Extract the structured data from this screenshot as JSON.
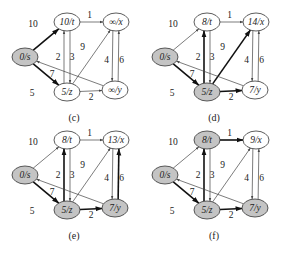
{
  "colors": {
    "shaded": "#c4c4c4",
    "unshaded": "#ffffff",
    "edge": "#444444",
    "edge_bold": "#111111"
  },
  "layout": {
    "node_positions": {
      "s": [
        25,
        57
      ],
      "t": [
        67,
        22
      ],
      "x": [
        116,
        22
      ],
      "z": [
        67,
        92
      ],
      "y": [
        115,
        90
      ]
    },
    "panel_offsets": [
      [
        0,
        0
      ],
      [
        140,
        0
      ],
      [
        0,
        118
      ],
      [
        140,
        118
      ]
    ],
    "caption_pos": [
      74,
      121
    ]
  },
  "edges": [
    {
      "from": "s",
      "to": "t",
      "weight": "10",
      "label_pos": [
        -13,
        -16
      ]
    },
    {
      "from": "s",
      "to": "z",
      "weight": "5",
      "label_pos": [
        -14,
        18
      ]
    },
    {
      "from": "t",
      "to": "x",
      "weight": "1",
      "label_pos": [
        -2,
        -7
      ]
    },
    {
      "from": "t",
      "to": "z",
      "weight": "2",
      "offset": -3,
      "label_pos": [
        -9,
        0
      ]
    },
    {
      "from": "z",
      "to": "t",
      "weight": "3",
      "offset": -3,
      "label_pos": [
        5,
        0
      ]
    },
    {
      "from": "z",
      "to": "x",
      "weight": "9",
      "label_pos": [
        -9,
        -10
      ]
    },
    {
      "from": "x",
      "to": "y",
      "weight": "4",
      "offset": 3,
      "label_pos": [
        -9,
        4
      ]
    },
    {
      "from": "y",
      "to": "x",
      "weight": "6",
      "offset": 3,
      "label_pos": [
        6,
        4
      ]
    },
    {
      "from": "y",
      "to": "s",
      "weight": "7",
      "label_pos": [
        -18,
        0
      ]
    },
    {
      "from": "z",
      "to": "y",
      "weight": "2",
      "label_pos": [
        0,
        6
      ]
    }
  ],
  "panels": [
    {
      "caption": "(c)",
      "nodes": {
        "s": {
          "label": "0/s",
          "shaded": true
        },
        "t": {
          "label": "10/t",
          "shaded": false
        },
        "x": {
          "label": "∞/x",
          "shaded": false
        },
        "z": {
          "label": "5/z",
          "shaded": false
        },
        "y": {
          "label": "∞/y",
          "shaded": false
        }
      },
      "bold_edges": [
        "s-t",
        "s-z"
      ]
    },
    {
      "caption": "(d)",
      "nodes": {
        "s": {
          "label": "0/s",
          "shaded": true
        },
        "t": {
          "label": "8/t",
          "shaded": false
        },
        "x": {
          "label": "14/x",
          "shaded": false
        },
        "z": {
          "label": "5/z",
          "shaded": true
        },
        "y": {
          "label": "7/y",
          "shaded": false
        }
      },
      "bold_edges": [
        "s-z",
        "z-t",
        "z-x",
        "z-y"
      ]
    },
    {
      "caption": "(e)",
      "nodes": {
        "s": {
          "label": "0/s",
          "shaded": true
        },
        "t": {
          "label": "8/t",
          "shaded": false
        },
        "x": {
          "label": "13/x",
          "shaded": false
        },
        "z": {
          "label": "5/z",
          "shaded": true
        },
        "y": {
          "label": "7/y",
          "shaded": true
        }
      },
      "bold_edges": [
        "s-z",
        "z-t",
        "z-y",
        "y-x"
      ]
    },
    {
      "caption": "(f)",
      "nodes": {
        "s": {
          "label": "0/s",
          "shaded": true
        },
        "t": {
          "label": "8/t",
          "shaded": true
        },
        "x": {
          "label": "9/x",
          "shaded": false
        },
        "z": {
          "label": "5/z",
          "shaded": true
        },
        "y": {
          "label": "7/y",
          "shaded": true
        }
      },
      "bold_edges": [
        "s-z",
        "z-t",
        "z-y",
        "t-x"
      ]
    }
  ]
}
